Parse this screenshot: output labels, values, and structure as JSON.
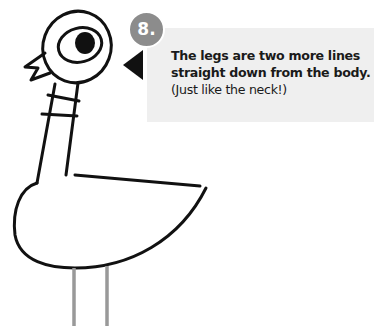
{
  "step": {
    "number": "8.",
    "instruction_bold_line1": "The legs are two more lines",
    "instruction_bold_line2": "straight down from the body.",
    "instruction_note": "(Just like the neck!)"
  },
  "colors": {
    "outline": "#111111",
    "new_lines": "#999999",
    "badge": "#8c8c8c",
    "tip_background": "#efefef"
  },
  "drawing": {
    "subject": "pigeon",
    "highlighted_part": "legs"
  }
}
